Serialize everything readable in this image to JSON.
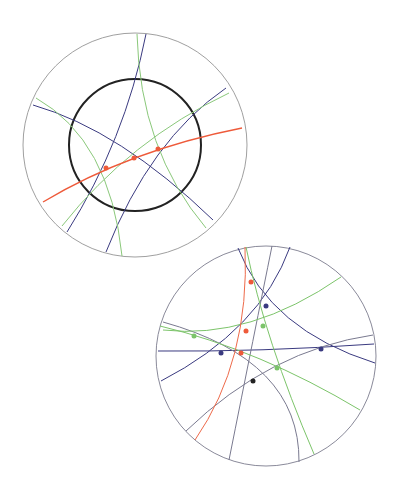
{
  "colors": {
    "boundary": "#9a9a9a",
    "black": "#222222",
    "blue": "#3a3a80",
    "green": "#7cc46a",
    "red": "#ee5a3a",
    "gray": "#7a7a90"
  },
  "diagrams": [
    {
      "name": "top-disk",
      "description": "Hyperbolic disk with inner black circle, geodesics and red curve with three points",
      "outer": {
        "cx": 135,
        "cy": 145,
        "r": 112
      },
      "inner_circle": {
        "cx": 135,
        "cy": 145,
        "r": 66
      },
      "red_points": [
        [
          106,
          168
        ],
        [
          134,
          158
        ],
        [
          158,
          149
        ]
      ]
    },
    {
      "name": "bottom-disk",
      "description": "Hyperbolic disk with intersecting geodesics and marked intersection points",
      "outer": {
        "cx": 266,
        "cy": 356,
        "r": 110
      },
      "points": {
        "red": [
          [
            251,
            282
          ],
          [
            246,
            331
          ],
          [
            241,
            353
          ]
        ],
        "blue": [
          [
            266,
            306
          ],
          [
            221,
            353
          ],
          [
            321,
            349
          ]
        ],
        "green": [
          [
            194,
            336
          ],
          [
            263,
            326
          ],
          [
            277,
            368
          ]
        ],
        "black": [
          [
            253,
            381
          ]
        ]
      }
    }
  ]
}
